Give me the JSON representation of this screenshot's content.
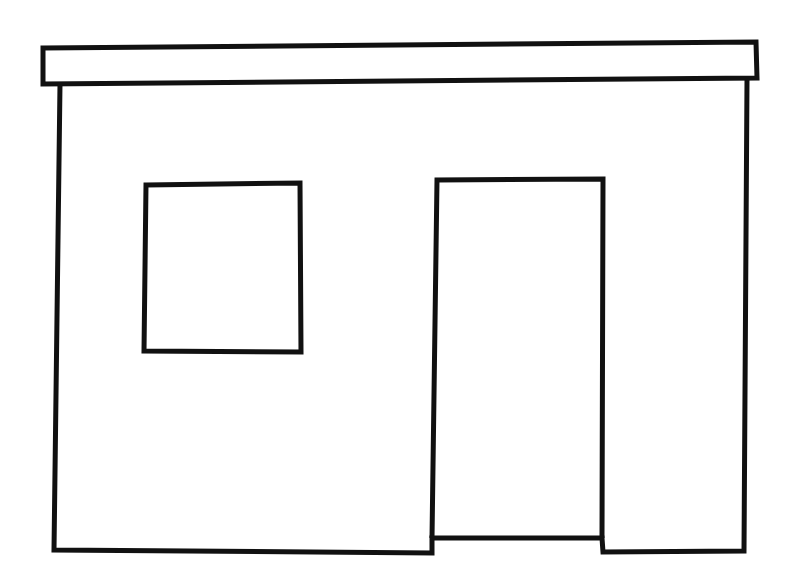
{
  "figure": {
    "stroke_color": "#111111",
    "background": "#ffffff",
    "parts": [
      "roof-slab",
      "wall",
      "window",
      "door"
    ]
  }
}
